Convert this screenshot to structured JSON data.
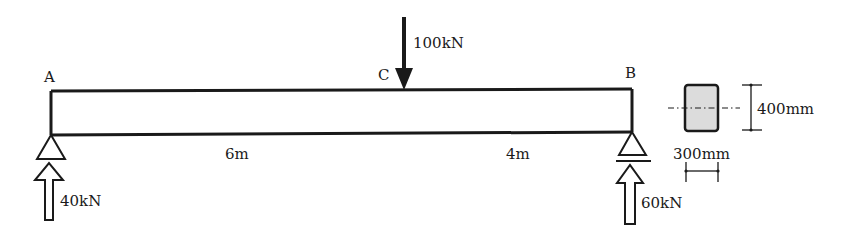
{
  "diagram": {
    "type": "simply-supported-beam",
    "points": {
      "A": {
        "label": "A"
      },
      "B": {
        "label": "B"
      },
      "C": {
        "label": "C"
      }
    },
    "load": {
      "label": "100kN",
      "value": 100,
      "unit": "kN",
      "at": "C"
    },
    "spans": [
      {
        "label": "6m",
        "from": "A",
        "to": "C"
      },
      {
        "label": "4m",
        "from": "C",
        "to": "B"
      }
    ],
    "reactions": [
      {
        "label": "40kN",
        "support": "A"
      },
      {
        "label": "60kN",
        "support": "B"
      }
    ],
    "section": {
      "height_label": "400mm",
      "width_label": "300mm",
      "fill": "#dcdcdc"
    }
  }
}
